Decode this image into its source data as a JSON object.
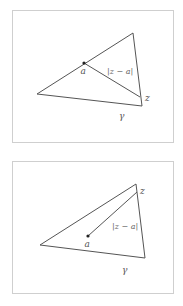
{
  "figures": [
    {
      "id": "top",
      "labels": {
        "point": "a",
        "distance": "|z − a|",
        "endpoint": "z",
        "curve": "γ"
      },
      "triangle": [
        [
          37,
          94
        ],
        [
          133,
          33
        ],
        [
          142,
          106
        ]
      ],
      "point_a": [
        84,
        63
      ],
      "point_z": [
        140,
        97
      ]
    },
    {
      "id": "bottom",
      "labels": {
        "point": "a",
        "distance": "|z − a|",
        "endpoint": "z",
        "curve": "γ"
      },
      "triangle": [
        [
          40,
          245
        ],
        [
          136,
          184
        ],
        [
          145,
          258
        ]
      ],
      "point_a": [
        88,
        236
      ],
      "point_z": [
        137,
        192
      ]
    }
  ],
  "colors": {
    "stroke": "#555555",
    "frame": "#cfcfcf",
    "label": "#555555"
  }
}
